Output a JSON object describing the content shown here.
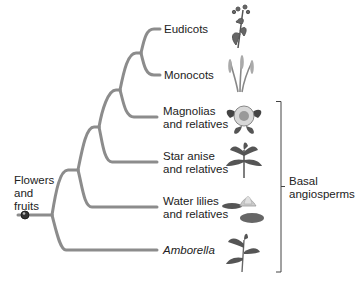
{
  "diagram": {
    "root_label": "Flowers\nand\nfruits",
    "taxa": [
      {
        "id": "eudicots",
        "label": "Eudicots",
        "italic": false,
        "icon": "eudicot-plant-icon"
      },
      {
        "id": "monocots",
        "label": "Monocots",
        "italic": false,
        "icon": "monocot-grass-icon"
      },
      {
        "id": "magnolias",
        "label": "Magnolias\nand relatives",
        "italic": false,
        "icon": "magnolia-flower-icon"
      },
      {
        "id": "star-anise",
        "label": "Star anise\nand relatives",
        "italic": false,
        "icon": "star-anise-plant-icon"
      },
      {
        "id": "water-lilies",
        "label": "Water lilies\nand relatives",
        "italic": false,
        "icon": "water-lily-icon"
      },
      {
        "id": "amborella",
        "label": "Amborella",
        "italic": true,
        "icon": "amborella-plant-icon"
      }
    ],
    "group_bracket": {
      "label": "Basal\nangiosperms",
      "members": [
        "magnolias",
        "star-anise",
        "water-lilies",
        "amborella"
      ]
    },
    "colors": {
      "branch": "#8c8c8c",
      "bracket": "#444444",
      "node_dot": "#333333",
      "text": "#222222"
    }
  }
}
